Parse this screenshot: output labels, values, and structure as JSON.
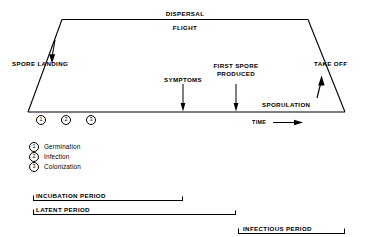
{
  "diagram": {
    "line_color": "#000000",
    "background": "#ffffff",
    "labels": {
      "dispersal": "DISPERSAL",
      "flight": "FLIGHT",
      "spore_landing": "SPORE LANDING",
      "take_off": "TAKE OFF",
      "symptoms": "SYMPTOMS",
      "first_spore_line1": "FIRST SPORE",
      "first_spore_line2": "PRODUCED",
      "sporulation": "SPORULATION",
      "time": "TIME"
    },
    "stages": [
      {
        "number": "1",
        "label": "Germination"
      },
      {
        "number": "2",
        "label": "Infection"
      },
      {
        "number": "3",
        "label": "Colonization"
      }
    ],
    "periods": [
      {
        "label": "INCUBATION PERIOD"
      },
      {
        "label": "LATENT PERIOD"
      },
      {
        "label": "INFECTIOUS PERIOD"
      }
    ]
  }
}
